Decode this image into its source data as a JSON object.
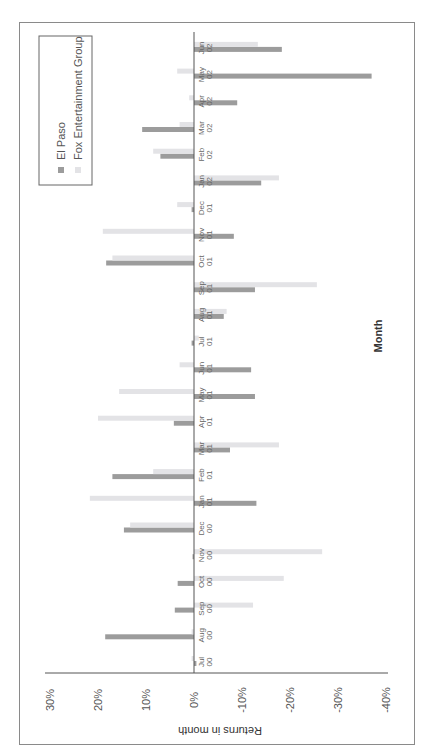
{
  "chart_data": {
    "type": "bar",
    "orientation": "rotated 90° (page landscape); bars grouped by month",
    "title": "",
    "xlabel": "Month",
    "ylabel": "Returns in month",
    "ylim": [
      -40,
      30
    ],
    "yticks": [
      "30%",
      "20%",
      "10%",
      "0%",
      "-10%",
      "-20%",
      "-30%",
      "-40%"
    ],
    "ytick_values": [
      30,
      20,
      10,
      0,
      -10,
      -20,
      -30,
      -40
    ],
    "grid": false,
    "legend_position": "upper-left (rotated frame)",
    "categories": [
      [
        "Jul",
        "00"
      ],
      [
        "Aug",
        "00"
      ],
      [
        "Sep",
        "00"
      ],
      [
        "Oct",
        "00"
      ],
      [
        "Nov",
        "00"
      ],
      [
        "Dec",
        "00"
      ],
      [
        "Jan",
        "01"
      ],
      [
        "Feb",
        "01"
      ],
      [
        "Mar",
        "01"
      ],
      [
        "Apr",
        "01"
      ],
      [
        "May",
        "01"
      ],
      [
        "Jun",
        "01"
      ],
      [
        "Jul",
        "01"
      ],
      [
        "Aug",
        "01"
      ],
      [
        "Sep",
        "01"
      ],
      [
        "Oct",
        "01"
      ],
      [
        "Nov",
        "01"
      ],
      [
        "Dec",
        "01"
      ],
      [
        "Jan",
        "02"
      ],
      [
        "Feb",
        "02"
      ],
      [
        "Mar",
        "02"
      ],
      [
        "Apr",
        "02"
      ],
      [
        "May",
        "02"
      ],
      [
        "Jun",
        "02"
      ]
    ],
    "series": [
      {
        "name": "El Paso",
        "color": "#9c9c9c",
        "values": [
          -0.5,
          18.5,
          4.0,
          3.4,
          0.3,
          14.6,
          -13.0,
          17.0,
          -7.5,
          4.2,
          -12.7,
          -11.9,
          0.5,
          -6.2,
          -12.7,
          18.3,
          -8.3,
          0.5,
          -14.0,
          7.0,
          10.8,
          -9.0,
          -37.0,
          -18.3
        ]
      },
      {
        "name": "Fox Entertainment Group",
        "color": "#e3e3e6",
        "values": [
          0.5,
          0.5,
          -12.3,
          -18.7,
          -26.7,
          13.3,
          21.7,
          8.5,
          -17.7,
          20.0,
          15.6,
          3.0,
          -1.0,
          -6.8,
          -25.6,
          17.0,
          19.0,
          3.5,
          -17.7,
          8.5,
          3.0,
          1.0,
          3.5,
          -13.3
        ]
      }
    ]
  },
  "legend": {
    "items": [
      {
        "label": "El Paso",
        "color": "#9c9c9c"
      },
      {
        "label": "Fox Entertainment Group",
        "color": "#e3e3e6"
      }
    ]
  },
  "axis": {
    "value_title": "Returns in month",
    "category_title": "Month"
  }
}
